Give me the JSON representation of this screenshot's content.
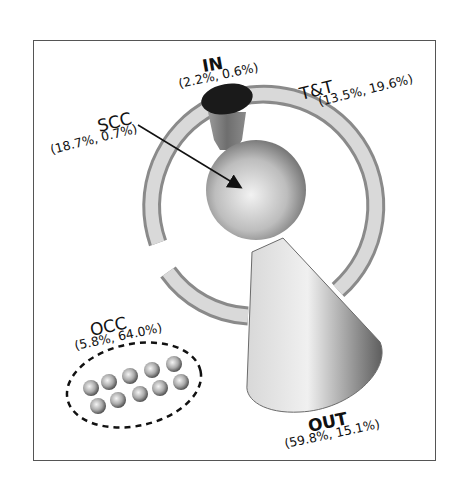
{
  "diagram": {
    "components": [
      {
        "id": "IN",
        "name": "IN",
        "values": "(2.2%, 0.6%)"
      },
      {
        "id": "TT",
        "name": "T&T",
        "values": "(13.5%, 19.6%)"
      },
      {
        "id": "SCC",
        "name": "SCC",
        "values": "(18.7%, 0.7%)"
      },
      {
        "id": "OCC",
        "name": "OCC",
        "values": "(5.8%, 64.0%)"
      },
      {
        "id": "OUT",
        "name": "OUT",
        "values": "(59.8%, 15.1%)"
      }
    ],
    "colors": {
      "in_cap": "#1a1a1a",
      "shape_light": "#e6e6e6",
      "shape_dark": "#5a5a5a",
      "border": "#555555",
      "arrow": "#111111"
    }
  }
}
